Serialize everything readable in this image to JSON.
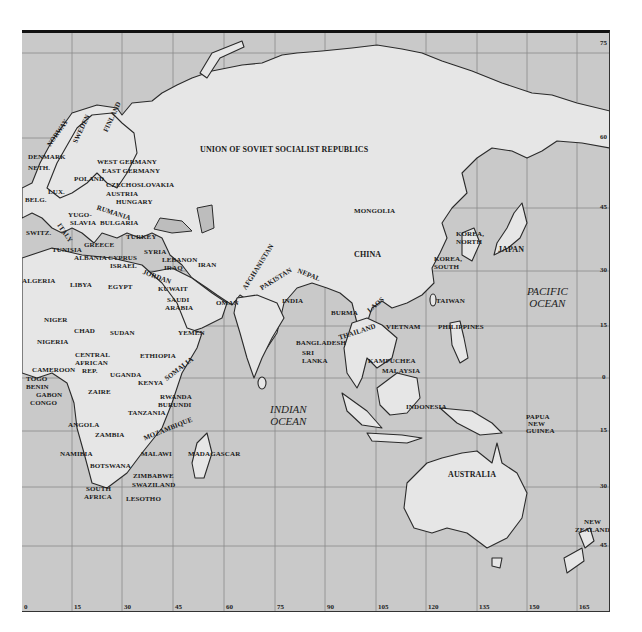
{
  "map": {
    "frame_color": "#c9c9c9",
    "land_color": "#e6e6e6",
    "border_color": "#2a2a2a",
    "longitude_labels": [
      "0",
      "15",
      "30",
      "45",
      "60",
      "75",
      "90",
      "105",
      "120",
      "135",
      "150",
      "165"
    ],
    "latitude_labels": [
      "75",
      "60",
      "45",
      "30",
      "15",
      "0",
      "15",
      "30",
      "45"
    ],
    "oceans": {
      "indian": {
        "line1": "INDIAN",
        "line2": "OCEAN"
      },
      "pacific": {
        "line1": "PACIFIC",
        "line2": "OCEAN"
      }
    },
    "countries": {
      "ussr": "UNION OF SOVIET SOCIALIST REPUBLICS",
      "norway": "NORWAY",
      "sweden": "SWEDEN",
      "finland": "FINLAND",
      "denmark": "DENMARK",
      "neth": "NETH.",
      "west_germany": "WEST GERMANY",
      "east_germany": "EAST GERMANY",
      "poland": "POLAND",
      "czechoslovakia": "CZECHOSLOVAKIA",
      "lux": "LUX.",
      "austria": "AUSTRIA",
      "belg": "BELG.",
      "hungary": "HUNGARY",
      "rumania": "RUMANIA",
      "yugoslavia_1": "YUGO-",
      "yugoslavia_2": "SLAVIA",
      "bulgaria": "BULGARIA",
      "switz": "SWITZ.",
      "italy": "ITALY",
      "turkey": "TURKEY",
      "greece": "GREECE",
      "tunisia": "TUNISIA",
      "albania": "ALBANIA",
      "cyprus": "CYPRUS",
      "syria": "SYRIA",
      "lebanon": "LEBANON",
      "israel": "ISRAEL",
      "iraq": "IRAQ",
      "iran": "IRAN",
      "jordan": "JORDAN",
      "kuwait": "KUWAIT",
      "algeria": "ALGERIA",
      "libya": "LIBYA",
      "egypt": "EGYPT",
      "saudi_1": "SAUDI",
      "saudi_2": "ARABIA",
      "oman": "OMAN",
      "yemen": "YEMEN",
      "niger": "NIGER",
      "chad": "CHAD",
      "sudan": "SUDAN",
      "nigeria": "NIGERIA",
      "car_1": "CENTRAL",
      "car_2": "AFRICAN",
      "car_3": "REP.",
      "ethiopia": "ETHIOPIA",
      "somalia": "SOMALIA",
      "cameroon": "CAMEROON",
      "togo": "TOGO",
      "benin": "BENIN",
      "gabon": "GABON",
      "congo": "CONGO",
      "uganda": "UGANDA",
      "kenya": "KENYA",
      "zaire": "ZAIRE",
      "rwanda": "RWANDA",
      "burundi": "BURUNDI",
      "tanzania": "TANZANIA",
      "angola": "ANGOLA",
      "zambia": "ZAMBIA",
      "mozambique": "MOZAMBIQUE",
      "malawi": "MALAWI",
      "madagascar": "MADAGASCAR",
      "namibia": "NAMIBIA",
      "botswana": "BOTSWANA",
      "zimbabwe": "ZIMBABWE",
      "swaziland": "SWAZILAND",
      "south_africa_1": "SOUTH",
      "south_africa_2": "AFRICA",
      "lesotho": "LESOTHO",
      "mongolia": "MONGOLIA",
      "china": "CHINA",
      "afghanistan": "AFGHANISTAN",
      "pakistan": "PAKISTAN",
      "nepal": "NEPAL",
      "india": "INDIA",
      "bangladesh": "BANGLADESH",
      "sri_lanka_1": "SRI",
      "sri_lanka_2": "LANKA",
      "burma": "BURMA",
      "laos": "LAOS",
      "thailand": "THAILAND",
      "vietnam": "VIETNAM",
      "kampuchea": "KAMPUCHEA",
      "malaysia": "MALAYSIA",
      "indonesia": "INDONESIA",
      "korea_north_1": "KOREA,",
      "korea_north_2": "NORTH",
      "korea_south_1": "KOREA,",
      "korea_south_2": "SOUTH",
      "japan": "JAPAN",
      "taiwan": "TAIWAN",
      "philippines": "PHILIPPINES",
      "png_1": "PAPUA",
      "png_2": "NEW",
      "png_3": "GUINEA",
      "australia": "AUSTRALIA",
      "nz_1": "NEW",
      "nz_2": "ZEALAND"
    }
  }
}
